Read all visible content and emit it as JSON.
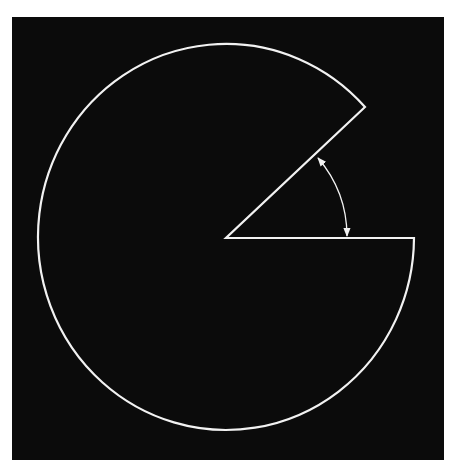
{
  "diagram": {
    "type": "circle-sector-cutout",
    "colors": {
      "page_background": "#ffffff",
      "panel_background": "#0b0b0b",
      "stroke": "#f2f2f2"
    },
    "panel": {
      "x": 12,
      "y": 17,
      "width": 432,
      "height": 443
    },
    "shape": {
      "center": {
        "x": 226,
        "y": 238
      },
      "rx": 188,
      "ry": 193,
      "start_point": {
        "x": 414,
        "y": 238
      },
      "end_point": {
        "x": 365,
        "y": 107
      },
      "missing_wedge_angle_deg": 45
    },
    "angle_marker": {
      "from": {
        "x": 347,
        "y": 237
      },
      "to": {
        "x": 318,
        "y": 157
      },
      "arrowheads": "both"
    }
  }
}
